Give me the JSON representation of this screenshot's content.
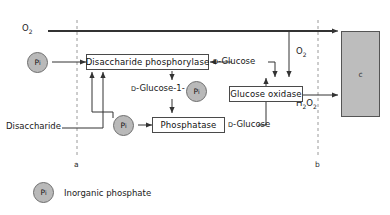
{
  "figure": {
    "type": "biochemical-flow-diagram",
    "background": "#ffffff",
    "line_color": "#333333",
    "box_fill": "#ffffff",
    "box_border": "#4a4a4a",
    "phosphate_fill": "#b9b9b9",
    "cell_fill": "#bdbdbd"
  },
  "substrates": {
    "oxygen_top": "O",
    "oxygen_top_sub": "2",
    "oxygen_mid": "O",
    "oxygen_mid_sub": "2",
    "peroxide": "H",
    "peroxide_sub1": "2",
    "peroxide_mid": "O",
    "peroxide_sub2": "2",
    "disaccharide": "Disaccharide"
  },
  "enzymes": [
    {
      "id": "disaccharide-phosphorylase",
      "label": "Disaccharide phosphorylase"
    },
    {
      "id": "glucose-oxidase",
      "label": "Glucose oxidase"
    },
    {
      "id": "phosphatase",
      "label": "Phosphatase"
    }
  ],
  "metabolites": [
    {
      "id": "d-glucose-top",
      "prefix": "D",
      "name": "-Glucose"
    },
    {
      "id": "d-glucose-1-phosphate",
      "prefix": "D",
      "name": "-Glucose-1-"
    },
    {
      "id": "d-glucose-bottom",
      "prefix": "D",
      "name": "-Glucose"
    }
  ],
  "phosphate_nodes": [
    {
      "id": "pi-left",
      "label": "P",
      "sub": "i"
    },
    {
      "id": "pi-glucose1p",
      "label": "P",
      "sub": "i"
    },
    {
      "id": "pi-phosphatase",
      "label": "P",
      "sub": "i"
    },
    {
      "id": "pi-legend",
      "label": "P",
      "sub": "i"
    }
  ],
  "boundaries": [
    {
      "id": "boundary-a",
      "label": "a"
    },
    {
      "id": "boundary-b",
      "label": "b"
    }
  ],
  "electrode": {
    "id": "electrode-c",
    "label": "c"
  },
  "legend": {
    "symbol": "P",
    "symbol_sub": "i",
    "text": "Inorganic phosphate"
  }
}
